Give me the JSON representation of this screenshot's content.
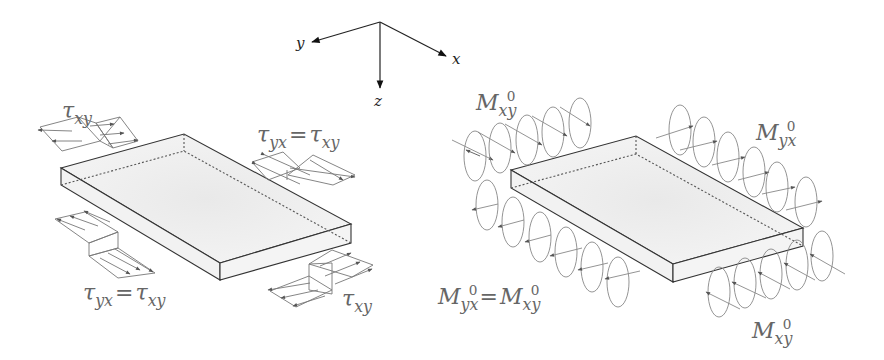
{
  "axes": {
    "x": "x",
    "y": "y",
    "z": "z"
  },
  "left_panel": {
    "title": "in-plane shear stresses on plate edges",
    "labels": [
      {
        "main": "τ",
        "sub": "xy"
      },
      {
        "main1": "τ",
        "sub1": "yx",
        "eq": "=",
        "main2": "τ",
        "sub2": "xy"
      },
      {
        "main1": "τ",
        "sub1": "yx",
        "eq": "=",
        "main2": "τ",
        "sub2": "xy"
      },
      {
        "main": "τ",
        "sub": "xy"
      }
    ]
  },
  "right_panel": {
    "title": "twisting moments on plate edges",
    "labels": [
      {
        "main": "M",
        "sub": "xy",
        "sup": "0"
      },
      {
        "main": "M",
        "sub": "yx",
        "sup": "0"
      },
      {
        "main1": "M",
        "sub1": "yx",
        "sup1": "0",
        "eq": "=",
        "main2": "M",
        "sub2": "xy",
        "sup2": "0"
      },
      {
        "main": "M",
        "sub": "xy",
        "sup": "0"
      }
    ]
  },
  "colors": {
    "line": "#333333",
    "arrow": "#555555",
    "plate_fill": "#efefef",
    "label": "#666666"
  }
}
